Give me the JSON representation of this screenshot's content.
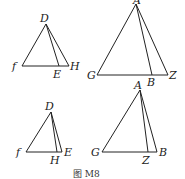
{
  "caption": "图  M8",
  "figures": [
    {
      "id": "top-left",
      "points": {
        "D": [
          46,
          24
        ],
        "f": [
          22,
          66
        ],
        "E": [
          59,
          66
        ],
        "H": [
          69,
          66
        ]
      },
      "labels": {
        "D": "D",
        "f": "f",
        "E": "E",
        "H": "H"
      }
    },
    {
      "id": "top-right",
      "points": {
        "A": [
          136,
          4
        ],
        "G": [
          97,
          75
        ],
        "B": [
          152,
          75
        ],
        "Z": [
          168,
          75
        ]
      },
      "labels": {
        "A": "A",
        "G": "G",
        "B": "B",
        "Z": "Z",
        "below": "A"
      }
    },
    {
      "id": "bottom-left",
      "points": {
        "D": [
          51,
          112
        ],
        "f": [
          26,
          152
        ],
        "H": [
          57,
          152
        ],
        "E": [
          62,
          152
        ]
      },
      "labels": {
        "D": "D",
        "f": "f",
        "H": "H",
        "E": "E"
      }
    },
    {
      "id": "bottom-right",
      "points": {
        "A": [
          140,
          90
        ],
        "G": [
          102,
          152
        ],
        "Z": [
          148,
          152
        ],
        "B": [
          157,
          152
        ]
      },
      "labels": {
        "A": "A",
        "G": "G",
        "Z": "Z",
        "B": "B"
      }
    }
  ]
}
